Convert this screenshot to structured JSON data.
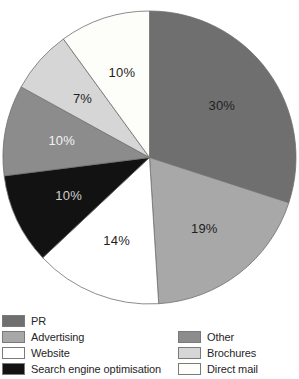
{
  "chart_data": {
    "type": "pie",
    "title": "",
    "start_angle_deg": 0,
    "direction": "clockwise",
    "legend_position": "bottom",
    "background_color": "#ffffff",
    "outline_color": "#6e6e6e",
    "slices": [
      {
        "label": "PR",
        "value_pct": 30,
        "data_label": "30%",
        "color": "#6f6f6f",
        "data_label_color": "#1f1f1f",
        "legend_column": "left"
      },
      {
        "label": "Advertising",
        "value_pct": 19,
        "data_label": "19%",
        "color": "#a8a8a8",
        "data_label_color": "#1f1f1f",
        "legend_column": "left"
      },
      {
        "label": "Website",
        "value_pct": 14,
        "data_label": "14%",
        "color": "#ffffff",
        "data_label_color": "#1f1f1f",
        "legend_column": "left"
      },
      {
        "label": "Search engine optimisation",
        "value_pct": 10,
        "data_label": "10%",
        "color": "#121212",
        "data_label_color": "#cfcfcf",
        "legend_column": "left"
      },
      {
        "label": "Other",
        "value_pct": 10,
        "data_label": "10%",
        "color": "#8c8c8c",
        "data_label_color": "#f2f2f2",
        "legend_column": "right"
      },
      {
        "label": "Brochures",
        "value_pct": 7,
        "data_label": "7%",
        "color": "#d6d6d6",
        "data_label_color": "#1f1f1f",
        "legend_column": "right"
      },
      {
        "label": "Direct mail",
        "value_pct": 10,
        "data_label": "10%",
        "color": "#fdfdfa",
        "data_label_color": "#1f1f1f",
        "legend_column": "right"
      }
    ]
  }
}
